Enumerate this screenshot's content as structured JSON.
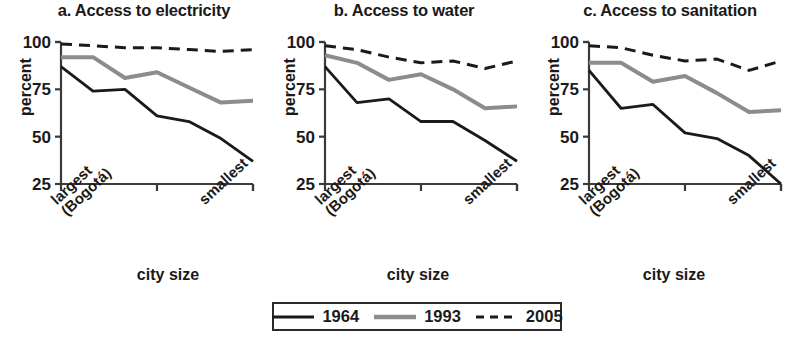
{
  "figure": {
    "axis_label_x": "city size",
    "axis_label_y": "percent",
    "tick_left": "largest\n(Bogotá)",
    "tick_left_line1": "largest",
    "tick_left_line2": "(Bogotá)",
    "tick_right": "smallest"
  },
  "legend": {
    "position": "bottom-center",
    "entries": [
      {
        "label": "1964",
        "color": "#1a1a1a",
        "style": "solid"
      },
      {
        "label": "1993",
        "color": "#8c8c8c",
        "style": "solid"
      },
      {
        "label": "2005",
        "color": "#1a1a1a",
        "style": "dashed"
      }
    ]
  },
  "colors": {
    "series_1964": "#1a1a1a",
    "series_1993": "#8c8c8c",
    "series_2005": "#1a1a1a",
    "axis": "#3a3a3a",
    "text": "#1a1a1a",
    "background": "#ffffff"
  },
  "chart_data": [
    {
      "type": "line",
      "panel": "a",
      "title": "a. Access to electricity",
      "xlabel": "city size",
      "ylabel": "percent",
      "ylim": [
        25,
        100
      ],
      "yticks": [
        25,
        50,
        75,
        100
      ],
      "ytick_labels": [
        "25",
        "50",
        "75",
        "100"
      ],
      "grid": false,
      "x": [
        1,
        2,
        3,
        4,
        5,
        6,
        7
      ],
      "xtick_positions": [
        1,
        4,
        7
      ],
      "xtick_labels": [
        "largest (Bogotá)",
        "",
        "smallest"
      ],
      "series": [
        {
          "name": "1964",
          "color": "#1a1a1a",
          "style": "solid",
          "values": [
            87,
            74,
            75,
            61,
            58,
            49,
            37
          ]
        },
        {
          "name": "1993",
          "color": "#8c8c8c",
          "style": "solid",
          "values": [
            92,
            92,
            81,
            84,
            76,
            68,
            69
          ]
        },
        {
          "name": "2005",
          "color": "#1a1a1a",
          "style": "dashed",
          "values": [
            99,
            98,
            97,
            97,
            96,
            95,
            96
          ]
        }
      ]
    },
    {
      "type": "line",
      "panel": "b",
      "title": "b. Access to water",
      "xlabel": "city size",
      "ylabel": "percent",
      "ylim": [
        25,
        100
      ],
      "yticks": [
        25,
        50,
        75,
        100
      ],
      "ytick_labels": [
        "25",
        "50",
        "75",
        "100"
      ],
      "grid": false,
      "x": [
        1,
        2,
        3,
        4,
        5,
        6,
        7
      ],
      "xtick_positions": [
        1,
        4,
        7
      ],
      "xtick_labels": [
        "largest (Bogotá)",
        "",
        "smallest"
      ],
      "series": [
        {
          "name": "1964",
          "color": "#1a1a1a",
          "style": "solid",
          "values": [
            87,
            68,
            70,
            58,
            58,
            48,
            37
          ]
        },
        {
          "name": "1993",
          "color": "#8c8c8c",
          "style": "solid",
          "values": [
            93,
            89,
            80,
            83,
            75,
            65,
            66
          ]
        },
        {
          "name": "2005",
          "color": "#1a1a1a",
          "style": "dashed",
          "values": [
            98,
            96,
            92,
            89,
            90,
            86,
            90
          ]
        }
      ]
    },
    {
      "type": "line",
      "panel": "c",
      "title": "c. Access to sanitation",
      "xlabel": "city size",
      "ylabel": "percent",
      "ylim": [
        25,
        100
      ],
      "yticks": [
        25,
        50,
        75,
        100
      ],
      "ytick_labels": [
        "25",
        "50",
        "75",
        "100"
      ],
      "grid": false,
      "x": [
        1,
        2,
        3,
        4,
        5,
        6,
        7
      ],
      "xtick_positions": [
        1,
        4,
        7
      ],
      "xtick_labels": [
        "largest (Bogotá)",
        "",
        "smallest"
      ],
      "series": [
        {
          "name": "1964",
          "color": "#1a1a1a",
          "style": "solid",
          "values": [
            85,
            65,
            67,
            52,
            49,
            40,
            25
          ]
        },
        {
          "name": "1993",
          "color": "#8c8c8c",
          "style": "solid",
          "values": [
            89,
            89,
            79,
            82,
            73,
            63,
            64
          ]
        },
        {
          "name": "2005",
          "color": "#1a1a1a",
          "style": "dashed",
          "values": [
            98,
            97,
            93,
            90,
            91,
            85,
            90
          ]
        }
      ]
    }
  ]
}
